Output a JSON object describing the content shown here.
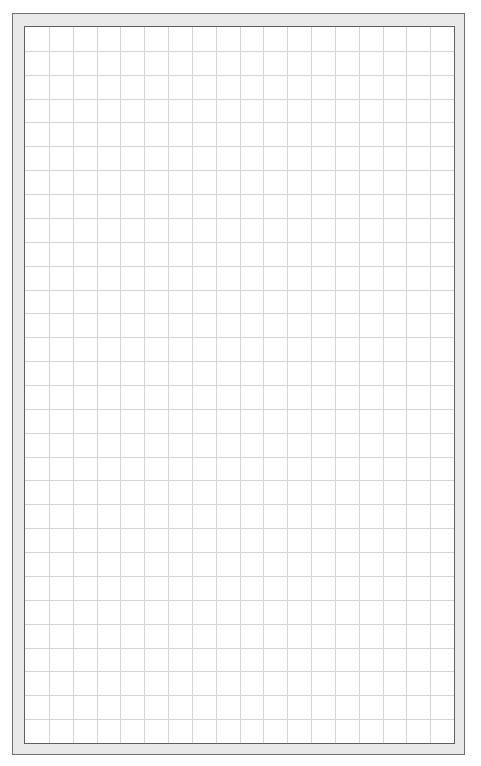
{
  "sheet": {
    "type": "grid-paper",
    "columns": 18,
    "rows": 30,
    "cell_size_px": 24,
    "colors": {
      "background": "#ffffff",
      "frame": "#e9e9e9",
      "frame_border": "#6f6f6f",
      "sheet_border": "#5f5f5f",
      "grid_line": "#d4d4d4"
    }
  }
}
